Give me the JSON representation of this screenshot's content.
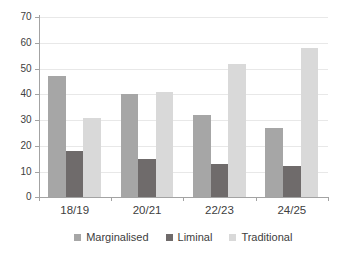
{
  "chart_data": {
    "type": "bar",
    "categories": [
      "18/19",
      "20/21",
      "22/23",
      "24/25"
    ],
    "series": [
      {
        "name": "Marginalised",
        "color": "#a6a6a6",
        "values": [
          47,
          40,
          32,
          27
        ]
      },
      {
        "name": "Liminal",
        "color": "#6f6b6b",
        "values": [
          18,
          15,
          13,
          12
        ]
      },
      {
        "name": "Traditional",
        "color": "#d9d9d9",
        "values": [
          31,
          41,
          52,
          58
        ]
      }
    ],
    "title": "",
    "xlabel": "",
    "ylabel": "",
    "ylim": [
      0,
      70
    ],
    "yticks": [
      0,
      10,
      20,
      30,
      40,
      50,
      60,
      70
    ],
    "grid": true,
    "legend_position": "bottom"
  },
  "colors": {
    "background": "#ffffff",
    "axis": "#a3a3a3",
    "gridline": "#e8e8e8",
    "text": "#404040"
  }
}
